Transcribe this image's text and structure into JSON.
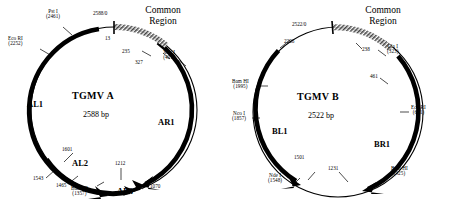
{
  "figure": {
    "type": "plasmid-map-pair",
    "maps": [
      {
        "id": "tgmv-a",
        "title": "TGMV A",
        "size_label": "2588 bp",
        "size_bp": 2588,
        "common_region_label_line1": "Common",
        "common_region_label_line2": "Region",
        "origin_label": "2588/0",
        "orfs": [
          {
            "name": "AL1"
          },
          {
            "name": "AR1"
          },
          {
            "name": "AL2"
          },
          {
            "name": "AL3"
          }
        ],
        "sites": [
          {
            "enzyme": "Pst I",
            "position": "(2461)"
          },
          {
            "enzyme": "Eco RI",
            "position": "(2252)"
          },
          {
            "enzyme": "Xba I",
            "position": "(401)"
          },
          {
            "enzyme": "Bam HI",
            "position": "(1357)"
          }
        ],
        "coordinates": [
          "13",
          "235",
          "327",
          "1070",
          "1212",
          "1465",
          "1543",
          "1601"
        ]
      },
      {
        "id": "tgmv-b",
        "title": "TGMV B",
        "size_label": "2522 bp",
        "size_bp": 2522,
        "common_region_label_line1": "Common",
        "common_region_label_line2": "Region",
        "origin_label": "2522/0",
        "orfs": [
          {
            "name": "BL1"
          },
          {
            "name": "BR1"
          }
        ],
        "sites": [
          {
            "enzyme": "Cla I",
            "position": "(323)"
          },
          {
            "enzyme": "Eco RI",
            "position": "(651)"
          },
          {
            "enzyme": "Bam HI",
            "position": "(925)"
          },
          {
            "enzyme": "Nde I",
            "position": "(1548)"
          },
          {
            "enzyme": "Nco I",
            "position": "(1857)"
          },
          {
            "enzyme": "Bam HI",
            "position": "(1995)"
          }
        ],
        "coordinates": [
          "238",
          "461",
          "1231",
          "1501",
          "2206"
        ]
      }
    ],
    "colors": {
      "line": "#000000",
      "background": "#ffffff",
      "common_region_hatch": "#555555"
    }
  }
}
